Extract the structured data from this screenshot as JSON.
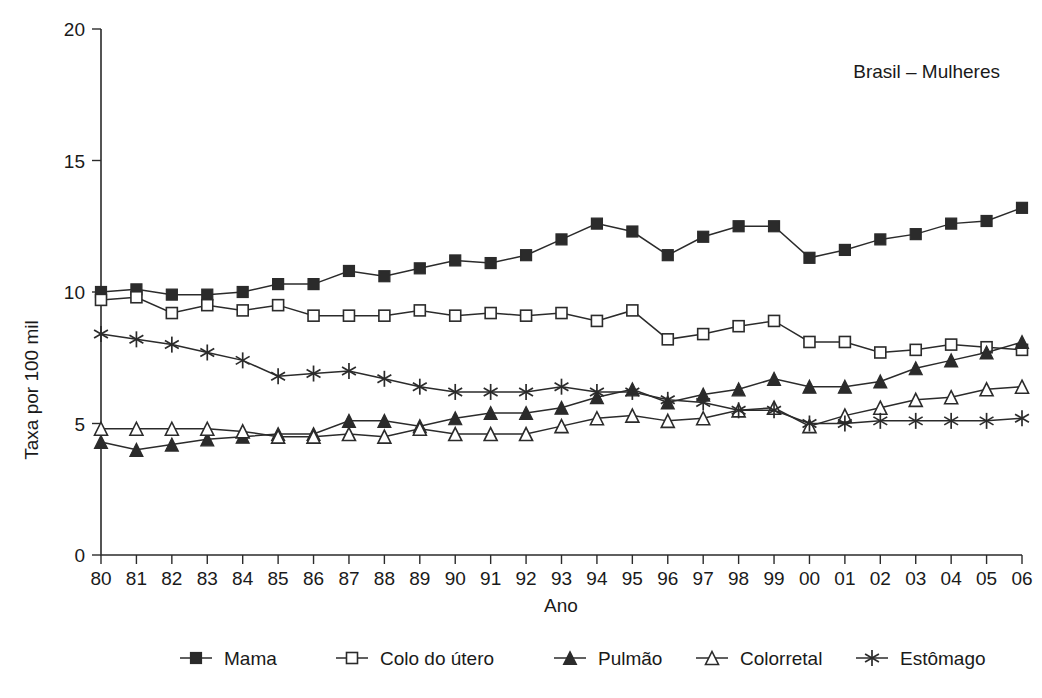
{
  "annotation": "Brasil – Mulheres",
  "axis": {
    "ylabel": "Taxa por 100 mil",
    "xlabel": "Ano",
    "yticks": [
      "0",
      "5",
      "10",
      "15",
      "20"
    ],
    "xticks": [
      "80",
      "81",
      "82",
      "83",
      "84",
      "85",
      "86",
      "87",
      "88",
      "89",
      "90",
      "91",
      "92",
      "93",
      "94",
      "95",
      "96",
      "97",
      "98",
      "99",
      "00",
      "01",
      "02",
      "03",
      "04",
      "05",
      "06"
    ]
  },
  "legend": {
    "items": [
      {
        "label": "Mama",
        "marker": "filled-square"
      },
      {
        "label": "Colo do útero",
        "marker": "open-square"
      },
      {
        "label": "Pulmão",
        "marker": "filled-triangle"
      },
      {
        "label": "Colorretal",
        "marker": "open-triangle"
      },
      {
        "label": "Estômago",
        "marker": "asterisk"
      }
    ]
  },
  "chart_data": {
    "type": "line",
    "title": "Brasil – Mulheres",
    "xlabel": "Ano",
    "ylabel": "Taxa por 100 mil",
    "ylim": [
      0,
      20
    ],
    "yticks": [
      0,
      5,
      10,
      15,
      20
    ],
    "grid": false,
    "legend_position": "bottom",
    "categories": [
      "80",
      "81",
      "82",
      "83",
      "84",
      "85",
      "86",
      "87",
      "88",
      "89",
      "90",
      "91",
      "92",
      "93",
      "94",
      "95",
      "96",
      "97",
      "98",
      "99",
      "00",
      "01",
      "02",
      "03",
      "04",
      "05",
      "06"
    ],
    "series": [
      {
        "name": "Mama",
        "marker": "filled-square",
        "values": [
          10.0,
          10.1,
          9.9,
          9.9,
          10.0,
          10.3,
          10.3,
          10.8,
          10.6,
          10.9,
          11.2,
          11.1,
          11.4,
          12.0,
          12.6,
          12.3,
          11.4,
          12.1,
          12.5,
          12.5,
          11.3,
          11.6,
          12.0,
          12.2,
          12.6,
          12.7,
          13.2
        ]
      },
      {
        "name": "Colo do útero",
        "marker": "open-square",
        "values": [
          9.7,
          9.8,
          9.2,
          9.5,
          9.3,
          9.5,
          9.1,
          9.1,
          9.1,
          9.3,
          9.1,
          9.2,
          9.1,
          9.2,
          8.9,
          9.3,
          8.2,
          8.4,
          8.7,
          8.9,
          8.1,
          8.1,
          7.7,
          7.8,
          8.0,
          7.9,
          7.8
        ]
      },
      {
        "name": "Pulmão",
        "marker": "filled-triangle",
        "values": [
          4.3,
          4.0,
          4.2,
          4.4,
          4.5,
          4.6,
          4.6,
          5.1,
          5.1,
          4.9,
          5.2,
          5.4,
          5.4,
          5.6,
          6.0,
          6.3,
          5.8,
          6.1,
          6.3,
          6.7,
          6.4,
          6.4,
          6.6,
          7.1,
          7.4,
          7.7,
          8.1
        ]
      },
      {
        "name": "Colorretal",
        "marker": "open-triangle",
        "values": [
          4.8,
          4.8,
          4.8,
          4.8,
          4.7,
          4.5,
          4.5,
          4.6,
          4.5,
          4.8,
          4.6,
          4.6,
          4.6,
          4.9,
          5.2,
          5.3,
          5.1,
          5.2,
          5.5,
          5.6,
          4.9,
          5.3,
          5.6,
          5.9,
          6.0,
          6.3,
          6.4
        ]
      },
      {
        "name": "Estômago",
        "marker": "asterisk",
        "values": [
          8.4,
          8.2,
          8.0,
          7.7,
          7.4,
          6.8,
          6.9,
          7.0,
          6.7,
          6.4,
          6.2,
          6.2,
          6.2,
          6.4,
          6.2,
          6.2,
          5.9,
          5.8,
          5.5,
          5.5,
          5.0,
          5.0,
          5.1,
          5.1,
          5.1,
          5.1,
          5.2
        ]
      }
    ]
  }
}
